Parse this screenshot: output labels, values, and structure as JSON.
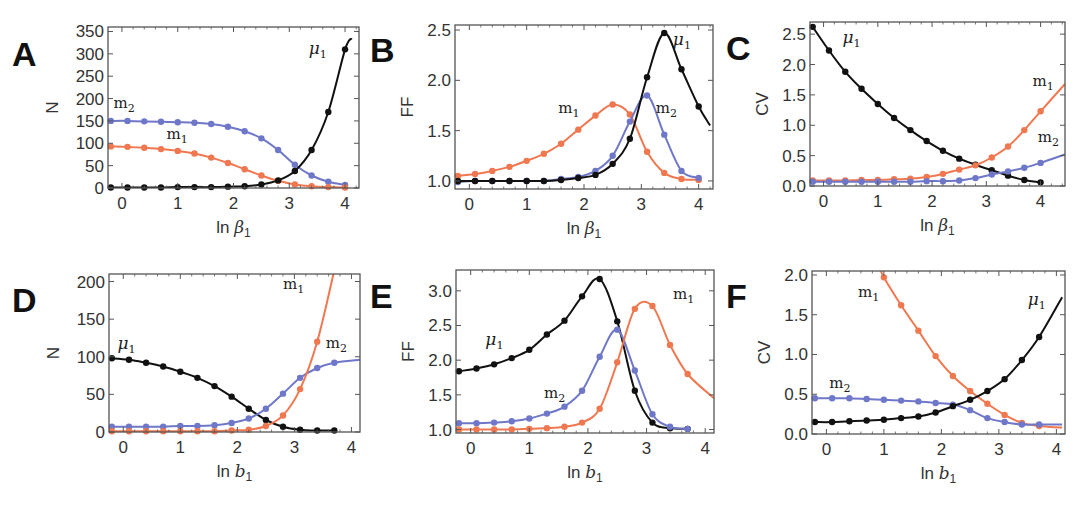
{
  "figure": {
    "colors": {
      "m1": "#f07850",
      "m2": "#6f78c8",
      "mu1": "#111111"
    }
  },
  "chart_data": [
    {
      "panel": "A",
      "type": "line",
      "xlabel": "ln β1",
      "ylabel": "N",
      "xlim": [
        -0.25,
        4.25
      ],
      "ylim": [
        0,
        360
      ],
      "xticks": [
        0,
        1,
        2,
        3,
        4
      ],
      "yticks": [
        0,
        50,
        100,
        150,
        200,
        250,
        300,
        350
      ],
      "frame": {
        "left": 108,
        "top": 27,
        "right": 359,
        "bottom": 188
      },
      "x": [
        -0.2,
        0.1,
        0.4,
        0.7,
        1.0,
        1.3,
        1.6,
        1.9,
        2.2,
        2.5,
        2.8,
        3.1,
        3.4,
        3.7,
        4.0
      ],
      "series": [
        {
          "name": "m2",
          "values": [
            150,
            150,
            149,
            148,
            147,
            146,
            143,
            137,
            127,
            111,
            85,
            52,
            28,
            14,
            7
          ]
        },
        {
          "name": "m1",
          "values": [
            93,
            92,
            90,
            87,
            83,
            77,
            68,
            56,
            42,
            28,
            16,
            8,
            4,
            2,
            1
          ]
        },
        {
          "name": "μ1",
          "values": [
            1,
            1,
            1,
            1,
            2,
            2,
            2,
            3,
            4,
            8,
            17,
            38,
            85,
            170,
            310
          ]
        }
      ],
      "curve_max": {
        "μ1": [
          4.12,
          335
        ]
      },
      "labels": [
        {
          "text": "m",
          "sub": "2",
          "series": "m2",
          "x": -0.15,
          "y": 180
        },
        {
          "text": "m",
          "sub": "1",
          "series": "m1",
          "x": 0.8,
          "y": 110
        },
        {
          "text": "μ",
          "sub": "1",
          "series": "μ1",
          "x": 3.35,
          "y": 300
        }
      ]
    },
    {
      "panel": "B",
      "type": "line",
      "xlabel": "ln β1",
      "ylabel": "FF",
      "xlim": [
        -0.25,
        4.25
      ],
      "ylim": [
        0.92,
        2.55
      ],
      "xticks": [
        0,
        1,
        2,
        3,
        4
      ],
      "yticks": [
        1.0,
        1.5,
        2.0,
        2.5
      ],
      "frame": {
        "left": 455,
        "top": 25,
        "right": 713,
        "bottom": 189
      },
      "x": [
        -0.2,
        0.1,
        0.4,
        0.7,
        1.0,
        1.3,
        1.6,
        1.9,
        2.2,
        2.5,
        2.8,
        3.1,
        3.4,
        3.7,
        4.0
      ],
      "series": [
        {
          "name": "m1",
          "values": [
            1.05,
            1.07,
            1.1,
            1.14,
            1.2,
            1.27,
            1.37,
            1.51,
            1.65,
            1.76,
            1.66,
            1.29,
            1.08,
            1.02,
            1.01
          ]
        },
        {
          "name": "m2",
          "values": [
            0.99,
            1.0,
            1.0,
            1.0,
            1.0,
            1.0,
            1.02,
            1.04,
            1.1,
            1.25,
            1.59,
            1.85,
            1.46,
            1.1,
            1.03
          ]
        },
        {
          "name": "μ1",
          "values": [
            1.0,
            1.0,
            1.0,
            1.0,
            1.0,
            1.0,
            1.01,
            1.03,
            1.06,
            1.17,
            1.42,
            2.03,
            2.47,
            2.11,
            1.74
          ]
        }
      ],
      "curve_end": {
        "μ1": [
          4.2,
          1.55
        ]
      },
      "labels": [
        {
          "text": "m",
          "sub": "1",
          "series": "m1",
          "x": 1.55,
          "y": 1.68
        },
        {
          "text": "m",
          "sub": "2",
          "series": "m2",
          "x": 3.25,
          "y": 1.68
        },
        {
          "text": "μ",
          "sub": "1",
          "series": "μ1",
          "x": 3.55,
          "y": 2.35
        }
      ]
    },
    {
      "panel": "C",
      "type": "line",
      "xlabel": "ln β1",
      "ylabel": "CV",
      "xlim": [
        -0.25,
        4.45
      ],
      "ylim": [
        0,
        2.7
      ],
      "xticks": [
        0,
        1,
        2,
        3,
        4
      ],
      "yticks": [
        0.0,
        0.5,
        1.0,
        1.5,
        2.0,
        2.5
      ],
      "frame": {
        "left": 810,
        "top": 22,
        "right": 1065,
        "bottom": 186
      },
      "x": [
        -0.2,
        0.1,
        0.4,
        0.7,
        1.0,
        1.3,
        1.6,
        1.9,
        2.2,
        2.5,
        2.8,
        3.1,
        3.4,
        3.7,
        4.0
      ],
      "series": [
        {
          "name": "μ1",
          "values": [
            2.62,
            2.23,
            1.88,
            1.6,
            1.35,
            1.12,
            0.92,
            0.74,
            0.58,
            0.45,
            0.35,
            0.26,
            0.17,
            0.1,
            0.06
          ]
        },
        {
          "name": "m1",
          "values": [
            0.09,
            0.09,
            0.09,
            0.1,
            0.1,
            0.11,
            0.12,
            0.15,
            0.2,
            0.27,
            0.34,
            0.47,
            0.65,
            0.92,
            1.23
          ]
        },
        {
          "name": "m2",
          "values": [
            0.07,
            0.07,
            0.07,
            0.07,
            0.07,
            0.07,
            0.07,
            0.08,
            0.08,
            0.09,
            0.13,
            0.19,
            0.24,
            0.3,
            0.38
          ]
        }
      ],
      "curve_end": {
        "m1": [
          4.45,
          1.68
        ],
        "m2": [
          4.45,
          0.52
        ]
      },
      "labels": [
        {
          "text": "μ",
          "sub": "1",
          "series": "μ1",
          "x": 0.35,
          "y": 2.35
        },
        {
          "text": "m",
          "sub": "1",
          "series": "m1",
          "x": 3.85,
          "y": 1.65
        },
        {
          "text": "m",
          "sub": "2",
          "series": "m2",
          "x": 3.95,
          "y": 0.72
        }
      ]
    },
    {
      "panel": "D",
      "type": "line",
      "xlabel": "ln b1",
      "ylabel": "N",
      "xlim": [
        -0.25,
        4.15
      ],
      "ylim": [
        0,
        210
      ],
      "xticks": [
        0,
        1,
        2,
        3,
        4
      ],
      "yticks": [
        0,
        50,
        100,
        150,
        200
      ],
      "frame": {
        "left": 109,
        "top": 274,
        "right": 360,
        "bottom": 432
      },
      "x": [
        -0.2,
        0.1,
        0.4,
        0.7,
        1.0,
        1.3,
        1.6,
        1.9,
        2.2,
        2.5,
        2.8,
        3.1,
        3.4,
        3.7
      ],
      "series": [
        {
          "name": "μ1",
          "values": [
            98,
            96,
            92,
            87,
            80,
            72,
            61,
            47,
            31,
            16,
            7,
            3,
            2,
            2
          ]
        },
        {
          "name": "m2",
          "values": [
            7,
            7,
            7,
            7,
            8,
            8,
            9,
            12,
            18,
            31,
            51,
            72,
            85,
            92
          ]
        },
        {
          "name": "m1",
          "values": [
            1,
            1,
            1,
            1,
            1,
            1,
            1,
            2,
            3,
            8,
            22,
            57,
            120,
            215
          ]
        }
      ],
      "curve_end": {
        "m2": [
          4.15,
          96
        ]
      },
      "labels": [
        {
          "text": "μ",
          "sub": "1",
          "series": "μ1",
          "x": -0.1,
          "y": 110
        },
        {
          "text": "m",
          "sub": "1",
          "series": "m1",
          "x": 2.8,
          "y": 190
        },
        {
          "text": "m",
          "sub": "2",
          "series": "m2",
          "x": 3.55,
          "y": 112
        }
      ]
    },
    {
      "panel": "E",
      "type": "line",
      "xlabel": "ln b1",
      "ylabel": "FF",
      "xlim": [
        -0.25,
        4.15
      ],
      "ylim": [
        0.95,
        3.3
      ],
      "xticks": [
        0,
        1,
        2,
        3,
        4
      ],
      "yticks": [
        1.0,
        1.5,
        2.0,
        2.5,
        3.0
      ],
      "frame": {
        "left": 456,
        "top": 270,
        "right": 714,
        "bottom": 433
      },
      "x": [
        -0.2,
        0.1,
        0.4,
        0.7,
        1.0,
        1.3,
        1.6,
        1.9,
        2.2,
        2.5,
        2.8,
        3.1,
        3.4,
        3.7
      ],
      "series": [
        {
          "name": "μ1",
          "values": [
            1.84,
            1.88,
            1.94,
            2.03,
            2.15,
            2.37,
            2.57,
            2.92,
            3.17,
            2.56,
            1.56,
            1.1,
            1.02,
            1.01
          ]
        },
        {
          "name": "m2",
          "values": [
            1.09,
            1.09,
            1.1,
            1.12,
            1.16,
            1.23,
            1.33,
            1.56,
            2.05,
            2.44,
            1.85,
            1.22,
            1.04,
            1.01
          ]
        },
        {
          "name": "m1",
          "values": [
            1.0,
            1.0,
            1.0,
            1.0,
            1.01,
            1.02,
            1.04,
            1.1,
            1.3,
            1.97,
            2.74,
            2.78,
            2.22,
            1.8
          ]
        }
      ],
      "curve_end": {
        "m1": [
          4.15,
          1.45
        ]
      },
      "labels": [
        {
          "text": "μ",
          "sub": "1",
          "series": "μ1",
          "x": 0.25,
          "y": 2.22
        },
        {
          "text": "m",
          "sub": "2",
          "series": "m2",
          "x": 1.25,
          "y": 1.45
        },
        {
          "text": "m",
          "sub": "1",
          "series": "m1",
          "x": 3.45,
          "y": 2.88
        }
      ]
    },
    {
      "panel": "F",
      "type": "line",
      "xlabel": "ln b1",
      "ylabel": "CV",
      "xlim": [
        -0.25,
        4.15
      ],
      "ylim": [
        0,
        2.05
      ],
      "xticks": [
        0,
        1,
        2,
        3,
        4
      ],
      "yticks": [
        0.0,
        0.5,
        1.0,
        1.5,
        2.0
      ],
      "frame": {
        "left": 812,
        "top": 271,
        "right": 1065,
        "bottom": 434
      },
      "x": [
        -0.2,
        0.1,
        0.4,
        0.7,
        1.0,
        1.3,
        1.6,
        1.9,
        2.2,
        2.5,
        2.8,
        3.1,
        3.4,
        3.7
      ],
      "series": [
        {
          "name": "m1",
          "values": [
            null,
            null,
            null,
            null,
            1.97,
            1.62,
            1.3,
            0.98,
            0.73,
            0.54,
            0.38,
            0.24,
            0.14,
            0.1
          ]
        },
        {
          "name": "m2",
          "values": [
            0.45,
            0.45,
            0.45,
            0.44,
            0.43,
            0.42,
            0.41,
            0.39,
            0.37,
            0.3,
            0.2,
            0.15,
            0.12,
            0.12
          ]
        },
        {
          "name": "μ1",
          "values": [
            0.15,
            0.15,
            0.16,
            0.17,
            0.18,
            0.2,
            0.22,
            0.27,
            0.35,
            0.43,
            0.54,
            0.69,
            0.93,
            1.22
          ]
        }
      ],
      "curve_start": {
        "m1": [
          0.95,
          2.05
        ]
      },
      "curve_end": {
        "μ1": [
          4.1,
          1.72
        ],
        "m1": [
          4.1,
          0.08
        ],
        "m2": [
          4.1,
          0.12
        ]
      },
      "labels": [
        {
          "text": "m",
          "sub": "1",
          "series": "m1",
          "x": 0.55,
          "y": 1.72
        },
        {
          "text": "m",
          "sub": "2",
          "series": "m2",
          "x": 0.05,
          "y": 0.58
        },
        {
          "text": "μ",
          "sub": "1",
          "series": "μ1",
          "x": 3.5,
          "y": 1.62
        }
      ]
    }
  ]
}
